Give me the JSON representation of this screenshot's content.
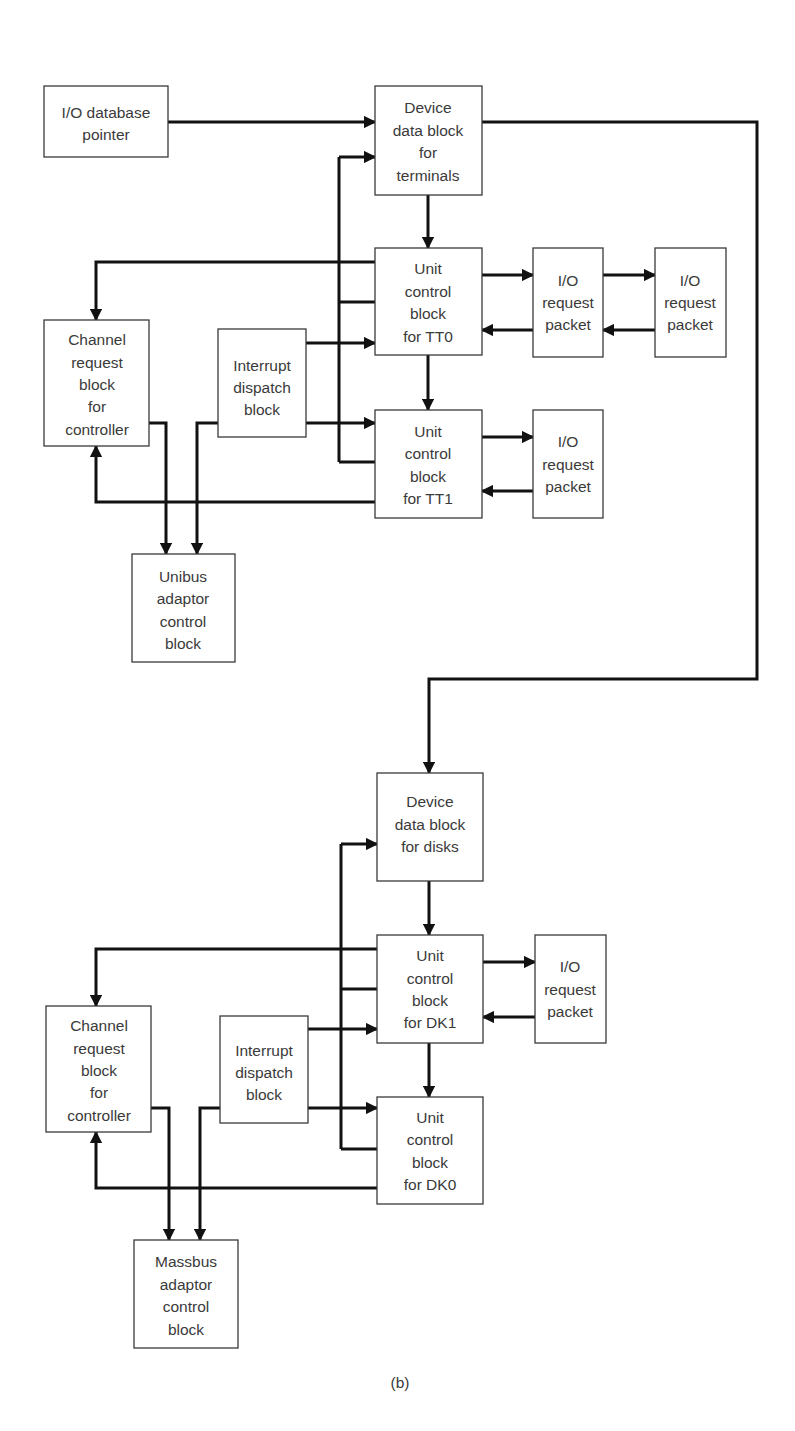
{
  "figure": {
    "caption": "(b)",
    "colors": {
      "line": "#111111",
      "box_border": "#3a3a3a",
      "text": "#3a3a3a",
      "background": "#ffffff"
    }
  },
  "top_section": {
    "io_database_pointer": {
      "lines": [
        "I/O database",
        "pointer"
      ]
    },
    "ddb_terminals": {
      "lines": [
        "Device",
        "data block",
        "for",
        "terminals"
      ]
    },
    "ucb_tt0": {
      "lines": [
        "Unit",
        "control",
        "block",
        "for TT0"
      ]
    },
    "ucb_tt1": {
      "lines": [
        "Unit",
        "control",
        "block",
        "for TT1"
      ]
    },
    "irp_tt0_a": {
      "lines": [
        "I/O",
        "request",
        "packet"
      ]
    },
    "irp_tt0_b": {
      "lines": [
        "I/O",
        "request",
        "packet"
      ]
    },
    "irp_tt1": {
      "lines": [
        "I/O",
        "request",
        "packet"
      ]
    },
    "crb": {
      "lines": [
        "Channel",
        "request",
        "block",
        "for",
        "controller"
      ]
    },
    "idb": {
      "lines": [
        "Interrupt",
        "dispatch",
        "block"
      ]
    },
    "adaptor": {
      "lines": [
        "Unibus",
        "adaptor",
        "control",
        "block"
      ]
    }
  },
  "bottom_section": {
    "ddb_disks": {
      "lines": [
        "Device",
        "data block",
        "for disks"
      ]
    },
    "ucb_dk1": {
      "lines": [
        "Unit",
        "control",
        "block",
        "for DK1"
      ]
    },
    "ucb_dk0": {
      "lines": [
        "Unit",
        "control",
        "block",
        "for DK0"
      ]
    },
    "irp_dk1": {
      "lines": [
        "I/O",
        "request",
        "packet"
      ]
    },
    "crb": {
      "lines": [
        "Channel",
        "request",
        "block",
        "for",
        "controller"
      ]
    },
    "idb": {
      "lines": [
        "Interrupt",
        "dispatch",
        "block"
      ]
    },
    "adaptor": {
      "lines": [
        "Massbus",
        "adaptor",
        "control",
        "block"
      ]
    }
  }
}
